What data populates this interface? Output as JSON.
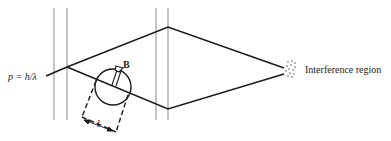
{
  "diagram": {
    "title": "",
    "labels": {
      "momentum": "p = h/λ",
      "field": "B",
      "length": "l",
      "interference": "Interference region"
    },
    "colors": {
      "line": "#1a1a1a",
      "screen": "#8a8a8a",
      "background": "#ffffff"
    },
    "elements": [
      "two pairs of vertical screens",
      "incoming beam splitting into two paths",
      "solenoid (circle) with magnetic field B",
      "dashed solenoid length l",
      "paths recombining at interference region"
    ]
  }
}
